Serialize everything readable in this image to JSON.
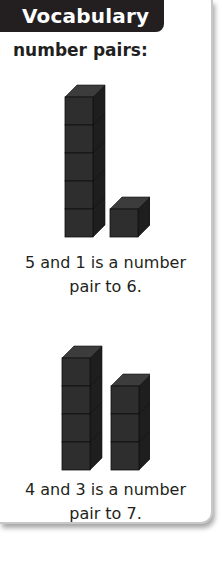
{
  "header": {
    "title": "Vocabulary"
  },
  "term": "number pairs:",
  "examples": [
    {
      "left_tower_cubes": 5,
      "right_tower_cubes": 1,
      "caption_line1": "5 and 1 is a number",
      "caption_line2": "pair to 6."
    },
    {
      "left_tower_cubes": 4,
      "right_tower_cubes": 3,
      "caption_line1": "4 and 3 is a number",
      "caption_line2": "pair to 7."
    }
  ],
  "colors": {
    "header_bg": "#231f20",
    "cube_front": "#2e2e2e",
    "cube_top": "#3c3c3c",
    "cube_side": "#1e1e1e"
  }
}
